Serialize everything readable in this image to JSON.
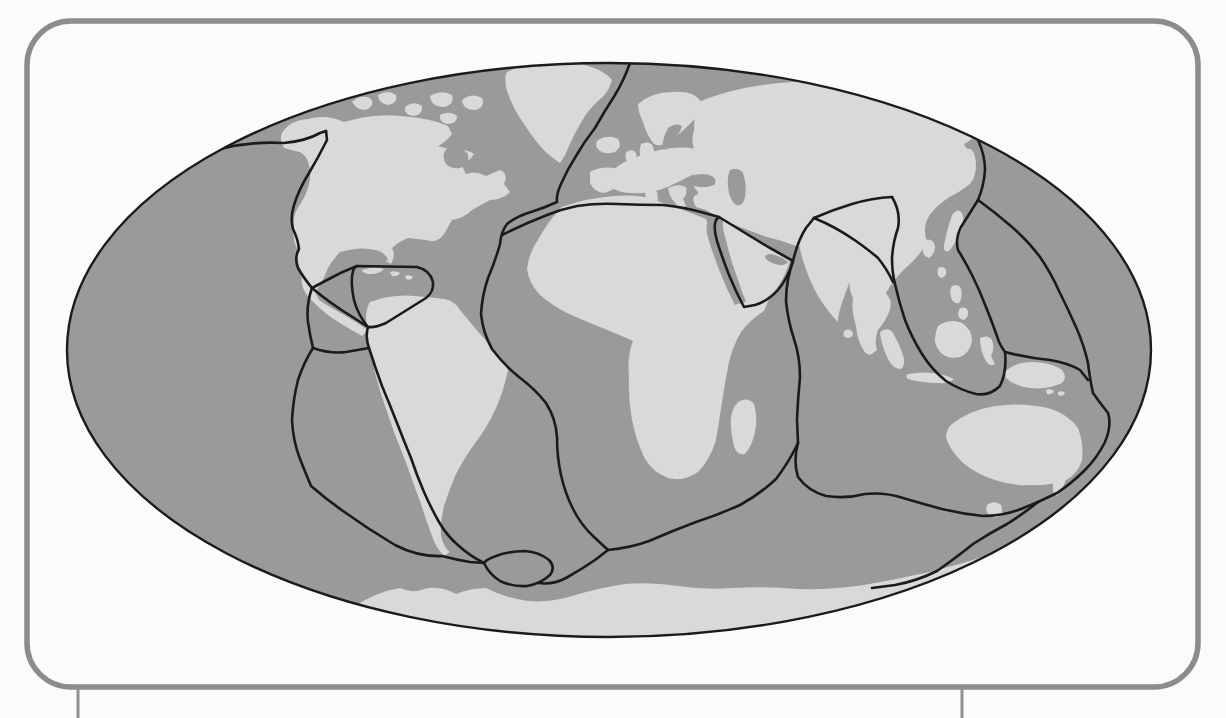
{
  "page": {
    "background": "#fbfbfa"
  },
  "frame": {
    "x": 27,
    "y": 21,
    "width": 1171,
    "height": 666,
    "radius": 44,
    "color": "#8a8c8e",
    "stroke_width": 5.5
  },
  "page_rule_lines": [
    {
      "name": "page-rule-left",
      "x": 78,
      "y1": 687,
      "y2": 718,
      "width": 3,
      "color": "#8f9193"
    },
    {
      "name": "page-rule-right",
      "x": 962,
      "y1": 687,
      "y2": 718,
      "width": 3,
      "color": "#8f9193"
    }
  ],
  "map": {
    "ellipse": {
      "cx": 609,
      "cy": 350,
      "rx": 542,
      "ry": 287
    },
    "colors": {
      "ocean": "#9a9a9b",
      "land": "#d9d9d8",
      "sea": "#9a9a9b",
      "boundary": "#1b1b1b",
      "outline": "#1b1b1b"
    },
    "boundary_stroke_width": 2.6,
    "outline_stroke_width": 2.4,
    "landmasses": [
      {
        "name": "north-america",
        "d": "M 282,133 Q 290,120 308,119 Q 326,114 344,122 L 360,118 Q 385,113 410,117 Q 432,119 448,126 L 452,134 Q 446,142 438,146 L 452,150 Q 466,148 474,154 Q 470,162 460,162 L 466,174 Q 476,170 486,176 L 500,170 Q 509,174 504,184 L 510,192 Q 502,200 490,200 L 472,210 Q 464,218 452,220 L 444,234 Q 437,244 426,240 L 408,238 Q 398,242 392,248 Q 396,256 391,264 Q 383,260 376,254 L 362,252 Q 350,250 340,252 Q 332,260 327,270 Q 323,282 315,292 L 319,300 Q 331,308 344,315 Q 356,322 368,330 L 362,336 Q 346,327 332,318 Q 318,308 306,294 Q 300,284 302,274 Q 296,262 298,250 Q 292,240 294,228 Q 292,216 299,206 Q 306,196 309,184 Q 312,172 308,162 Q 305,152 295,151 L 284,148 Q 279,140 282,133 Z"
      },
      {
        "name": "greenland",
        "d": "M 506,73 Q 522,63 545,62 Q 568,60 588,66 Q 605,71 612,80 Q 608,94 598,101 Q 588,110 582,121 Q 574,134 569,146 Q 566,155 560,163 Q 549,156 540,146 Q 530,134 522,121 Q 513,108 509,96 Q 504,86 506,73 Z"
      },
      {
        "name": "arctic-islands",
        "d": "M 352,102 q 8,-8 18,-4 q 6,6 -2,11 q -10,3 -16,-7 Z M 378,95 q 10,-6 18,0 q 2,8 -8,10 q -10,-2 -10,-10 Z M 405,107 q 9,-7 17,-1 q 1,9 -9,10 q -9,-1 -8,-9 Z M 430,96 q 12,-7 22,-1 q 3,9 -8,12 q -13,0 -14,-11 Z M 440,115 q 10,-5 17,1 q 0,8 -9,8 q -9,-1 -8,-9 Z M 462,100 q 10,-8 20,-2 q 4,9 -7,12 q -12,0 -13,-10 Z"
      },
      {
        "name": "iceland",
        "d": "M 598,140 q 10,-6 20,-1 q 5,7 -3,13 q -12,4 -18,-4 q -2,-5 1,-8 Z"
      },
      {
        "name": "british-isles",
        "d": "M 641,144 q 8,-4 12,2 q 3,10 -2,20 q -6,4 -9,-3 q -4,-10 -1,-19 Z M 626,152 q 7,-4 10,1 q 2,7 -4,10 q -8,0 -6,-11 Z"
      },
      {
        "name": "scandinavia",
        "d": "M 638,104 Q 652,92 672,92 Q 692,90 700,100 Q 703,112 694,120 Q 684,130 672,140 Q 662,148 654,144 Q 646,134 643,122 Q 638,112 638,104 Z"
      },
      {
        "name": "europe",
        "d": "M 606,178 Q 616,164 634,158 Q 652,150 672,148 Q 692,146 706,152 L 716,158 Q 706,168 694,174 Q 682,180 670,186 Q 656,192 642,193 Q 626,194 616,190 Q 606,186 606,178 Z"
      },
      {
        "name": "iberia",
        "d": "M 590,172 Q 600,166 614,168 Q 624,170 622,180 Q 616,190 604,193 Q 594,192 590,183 Z"
      },
      {
        "name": "italy",
        "d": "M 645,190 q 8,-4 12,2 q 2,8 -1,14 l 2,6 q -5,3 -8,-3 q -5,-9 -5,-19 Z"
      },
      {
        "name": "balkans-greece",
        "d": "M 668,188 q 10,-5 18,-1 q 2,7 -3,12 l 3,7 q -6,4 -10,-2 q -7,-7 -8,-16 Z"
      },
      {
        "name": "anatolia",
        "d": "M 694,196 q 14,-6 28,-3 l 14,6 q -4,9 -14,10 q -14,3 -26,-2 q -4,-6 -2,-11 Z"
      },
      {
        "name": "asia-mainland",
        "d": "M 698,102 Q 740,85 792,82 Q 845,78 893,88 Q 932,95 958,108 Q 974,118 980,128 Q 976,138 964,144 Q 970,154 974,166 Q 976,176 970,184 Q 960,192 948,198 Q 936,206 929,216 Q 922,228 927,242 Q 921,254 910,264 Q 898,274 889,288 Q 881,300 878,314 Q 872,326 866,334 Q 871,344 874,352 Q 870,358 864,351 Q 857,340 856,326 Q 851,312 853,298 Q 847,286 851,272 Q 843,262 828,256 Q 812,250 796,246 Q 780,240 764,236 Q 748,230 732,224 Q 718,218 706,210 Q 696,202 698,192 Q 690,184 694,174 Q 688,164 696,154 Q 690,142 694,130 Q 694,114 698,102 Z"
      },
      {
        "name": "kamchatka",
        "d": "M 962,150 q 8,-4 12,3 q 4,12 0,24 q -3,8 -9,4 q -6,-12 -6,-22 q 0,-6 3,-9 Z"
      },
      {
        "name": "japan-sakhalin",
        "d": "M 952,215 q 6,-8 10,-2 q 3,9 -1,18 q -5,12 -12,20 q -6,2 -5,-6 q 3,-16 8,-30 Z"
      },
      {
        "name": "korea",
        "d": "M 925,240 q 8,-2 10,6 q 0,8 -6,12 q -7,-2 -6,-9 q 0,-5 2,-9 Z"
      },
      {
        "name": "india",
        "d": "M 800,238 Q 822,228 846,238 Q 858,248 855,264 Q 850,282 843,300 Q 838,314 838,322 Q 828,312 818,296 Q 808,278 803,260 Q 798,246 800,238 Z"
      },
      {
        "name": "sri-lanka",
        "d": "M 845,330 q 6,-2 8,3 q 0,5 -6,5 q -6,-2 -2,-8 Z"
      },
      {
        "name": "indochina-malay",
        "d": "M 862,300 Q 872,290 884,292 Q 893,298 890,310 Q 885,322 878,330 Q 874,340 877,350 Q 871,356 866,348 Q 860,336 860,322 Q 858,310 862,300 Z"
      },
      {
        "name": "arabia",
        "d": "M 723,220 Q 748,234 772,248 L 790,260 Q 786,275 777,288 Q 768,299 756,304 L 747,304 Q 741,290 736,274 Q 730,258 726,240 Q 722,228 723,220 Z"
      },
      {
        "name": "africa",
        "d": "M 565,206 Q 588,198 614,196 Q 638,194 652,199 L 674,207 Q 692,213 706,219 Q 713,238 721,262 Q 728,284 736,300 L 739,304 Q 753,299 769,299 L 764,311 Q 750,320 741,332 Q 733,346 729,362 Q 725,382 722,402 Q 719,422 716,440 Q 710,460 698,472 Q 684,482 668,478 Q 652,472 644,457 Q 636,440 632,420 Q 628,398 629,377 Q 627,356 633,341 Q 620,335 605,329 Q 587,322 569,314 Q 551,305 539,294 Q 529,283 527,269 Q 529,252 539,238 Q 548,222 558,211 Q 561,206 565,206 Z"
      },
      {
        "name": "madagascar",
        "d": "M 738,402 q 10,-6 16,2 q 4,14 1,28 q -3,14 -10,22 q -8,2 -11,-8 q -4,-16 -3,-28 q 1,-10 7,-16 Z"
      },
      {
        "name": "south-america",
        "d": "M 370,302 Q 392,294 415,296 L 445,299 Q 456,302 460,310 Q 470,322 480,334 Q 492,346 502,360 L 508,370 Q 504,390 496,408 Q 488,426 476,442 Q 464,458 456,474 Q 449,490 444,506 Q 440,522 441,536 Q 444,548 450,552 L 444,556 Q 436,548 432,536 Q 426,520 421,504 Q 414,486 408,468 Q 401,450 394,432 Q 387,412 381,394 Q 375,374 371,356 Q 367,336 366,318 Q 366,308 370,302 Z"
      },
      {
        "name": "caribbean-islands",
        "d": "M 362,270 q 12,-4 22,-1 q -4,5 -14,5 q -7,0 -8,-4 Z M 390,272 q 6,-2 10,1 q -2,4 -8,3 Z M 405,276 q 5,-2 8,1 q -2,4 -7,2 Z"
      },
      {
        "name": "sumatra",
        "d": "M 880,332 q 8,-6 13,1 q 6,10 10,22 q 3,10 -2,14 q -8,0 -13,-10 q -7,-14 -8,-27 Z"
      },
      {
        "name": "java",
        "d": "M 908,374 q 16,-3 32,0 q 8,2 14,5 q -6,5 -16,4 q -16,0 -30,-4 q -3,-3 0,-5 Z"
      },
      {
        "name": "borneo",
        "d": "M 938,326 q 12,-8 24,-3 q 10,6 10,18 q -2,12 -12,16 q -12,3 -20,-5 q -6,-8 -5,-14 q 1,-8 3,-12 Z"
      },
      {
        "name": "sulawesi",
        "d": "M 980,338 q 8,-4 12,2 q 3,8 -1,16 l 4,8 q -6,3 -9,-3 q -6,-10 -6,-23 Z"
      },
      {
        "name": "philippines",
        "d": "M 952,286 q 7,-3 9,3 q 2,8 -2,14 q -6,1 -8,-6 q -2,-7 1,-11 Z M 960,308 q 6,-2 8,3 q 1,6 -4,9 q -6,-1 -6,-7 Z"
      },
      {
        "name": "taiwan",
        "d": "M 938,268 q 6,-3 8,2 q 1,6 -4,8 q -6,-1 -4,-10 Z"
      },
      {
        "name": "new-guinea",
        "d": "M 1005,372 Q 1015,362 1032,362 Q 1050,362 1062,370 Q 1068,377 1062,383 Q 1048,390 1030,388 Q 1014,386 1006,378 Z M 1046,390 q 5,-2 8,1 q -2,4 -7,3 Z M 1058,392 q 5,-2 7,1 q -2,4 -7,2 Z"
      },
      {
        "name": "australia",
        "d": "M 952,424 Q 970,410 995,406 Q 1022,402 1048,408 Q 1068,414 1078,428 Q 1084,444 1082,460 Q 1078,474 1066,480 Q 1050,486 1032,485 Q 1012,486 995,480 Q 976,474 962,462 Q 950,450 946,438 Q 946,429 952,424 Z"
      },
      {
        "name": "tasmania",
        "d": "M 988,504 q 8,-4 13,1 q 3,7 -3,12 q -8,2 -11,-5 q -2,-5 1,-8 Z"
      },
      {
        "name": "new-zealand",
        "d": "M 1055,474 q 7,-6 10,0 q 2,8 -3,14 l -5,8 q -5,-2 -4,-9 q 0,-8 2,-13 Z"
      },
      {
        "name": "antarctica",
        "d": "M 352,608 Q 375,592 400,588 Q 412,594 424,589 Q 440,585 456,594 Q 470,588 486,588 Q 505,598 528,601 Q 550,603 572,596 Q 598,588 625,584 Q 652,582 678,586 Q 705,590 732,588 Q 765,586 798,589 Q 832,590 864,585 Q 898,579 930,572 Q 962,564 995,553 Q 1020,546 1045,544 L 1058,645 L 345,645 Z"
      }
    ],
    "seas": [
      {
        "name": "hudson-bay",
        "d": "M 448,148 q 14,-2 20,6 q 2,10 -8,14 q -12,2 -16,-8 q -2,-8 4,-12 Z"
      },
      {
        "name": "gulf-of-mexico",
        "d": "M 342,252 q 16,-6 34,-2 q 10,3 12,10 q -14,6 -30,4 q -14,-2 -18,-7 q -2,-3 2,-5 Z"
      },
      {
        "name": "baltic-sea",
        "d": "M 668,128 q 8,-6 14,-2 q -2,8 -10,14 l -6,10 q -5,-2 -3,-9 q 2,-8 5,-13 Z"
      },
      {
        "name": "black-sea",
        "d": "M 692,176 q 10,-4 20,0 q 6,4 2,9 q -10,4 -20,1 q -6,-5 -2,-10 Z"
      },
      {
        "name": "caspian-sea",
        "d": "M 730,170 q 9,-3 13,3 q 4,12 2,24 q -2,10 -9,8 q -7,-6 -8,-18 q -1,-11 2,-17 Z"
      },
      {
        "name": "red-sea",
        "d": "M 710,219 Q 716,238 723,258 Q 729,276 736,292 L 741,302 L 735,305 Q 727,290 720,272 Q 712,252 707,234 Q 705,224 710,219 Z"
      },
      {
        "name": "persian-gulf",
        "d": "M 770,254 q 12,2 18,8 q -4,5 -13,2 q -9,-3 -10,-7 q 1,-3 5,-3 Z"
      }
    ],
    "plate_boundaries": [
      {
        "name": "aleutian-trench-west",
        "d": "M 220,149 Q 252,141 284,143 Q 306,141 320,133 L 326,131"
      },
      {
        "name": "pacific-north-america-boundary",
        "d": "M 326,131 L 327,140 Q 318,158 309,173 Q 299,189 294,205 Q 290,218 293,229 Q 298,239 299,249 Q 294,258 298,268 Q 303,277 312,288"
      },
      {
        "name": "middle-america-trench",
        "d": "M 312,288 Q 331,304 351,316 L 368,327"
      },
      {
        "name": "caribbean-plate-outline",
        "d": "M 357,266 L 417,267 Q 430,270 433,282 Q 434,292 426,298 L 386,323 Q 375,328 368,327 Q 358,315 354,300 Q 350,281 353,271 Q 354,267 357,266 Z"
      },
      {
        "name": "cocos-caribbean-link",
        "d": "M 357,266 Q 341,272 327,280 L 312,288"
      },
      {
        "name": "east-pacific-rise",
        "d": "M 312,288 Q 306,305 308,322 Q 310,336 313,348 Q 304,362 298,380 Q 293,400 292,420 Q 293,441 300,459 Q 306,474 311,486 Q 326,499 343,511 Q 368,529 395,545 Q 418,557 442,556 Q 457,560 470,562 L 484,563"
      },
      {
        "name": "galapagos-ridge",
        "d": "M 313,348 Q 330,354 346,352 L 369,348"
      },
      {
        "name": "peru-chile-trench",
        "d": "M 368,327 Q 365,337 369,348 Q 375,367 382,386 Q 390,405 397,423 Q 404,441 411,458 Q 417,476 424,492 Q 431,508 439,522 Q 447,536 459,546 Q 470,556 484,563"
      },
      {
        "name": "scotia-arc",
        "d": "M 484,563 Q 489,574 500,581 Q 513,587 527,586 Q 540,584 550,575 Q 556,567 549,560 Q 539,552 525,551 Q 509,551 496,556 Q 487,559 484,563 Z"
      },
      {
        "name": "scotia-atlantic-link",
        "d": "M 538,583 Q 553,585 566,578 Q 582,569 595,560 L 608,550"
      },
      {
        "name": "mid-atlantic-ridge",
        "d": "M 630,63 Q 624,80 615,95 Q 604,112 595,128 Q 584,142 576,156 Q 567,170 561,184 Q 556,195 557,202 Q 544,208 531,212 Q 517,216 507,224 Q 501,232 500,244 Q 495,262 488,278 Q 482,296 481,314 Q 483,333 492,349 Q 504,365 519,377 Q 535,389 546,403 Q 556,419 557,437 Q 557,457 561,475 Q 565,493 573,509 Q 581,525 594,537 L 608,550"
      },
      {
        "name": "eurasia-africa-boundary",
        "d": "M 502,235 Q 524,224 547,215 Q 562,209 577,206 Q 597,203 617,204 Q 641,205 663,205 Q 683,207 701,212 L 719,217"
      },
      {
        "name": "arabian-plate-outline",
        "d": "M 719,217 Q 745,233 770,248 L 793,261 Q 788,278 778,290 Q 768,301 755,305 L 744,307 Q 736,292 729,275 Q 722,257 717,241 Q 713,227 716,220 L 719,217 Z"
      },
      {
        "name": "zagros-link",
        "d": "M 793,261 Q 798,240 806,228 L 814,218"
      },
      {
        "name": "himalayan-front",
        "d": "M 814,218 Q 832,210 852,204 Q 872,198 892,197"
      },
      {
        "name": "iran-makran-boundary",
        "d": "M 814,218 Q 836,227 856,241 Q 870,251 878,258 Q 887,269 893,282"
      },
      {
        "name": "burma-sunda-trench",
        "d": "M 892,197 Q 901,212 898,228 Q 893,242 892,258 Q 892,272 895,284 Q 899,302 905,320 Q 912,338 922,354 Q 932,370 946,381 Q 960,390 976,394 Q 990,396 1000,386 Q 1007,372 1005,352"
      },
      {
        "name": "owen-central-indian-ridge",
        "d": "M 793,261 Q 786,281 786,301 Q 788,321 794,339 Q 800,357 800,377 Q 798,397 797,419 L 798,443"
      },
      {
        "name": "southwest-indian-ridge",
        "d": "M 798,443 Q 789,462 776,479 Q 760,494 740,505 Q 718,515 696,522 Q 672,531 649,541 Q 630,548 608,550"
      },
      {
        "name": "southeast-indian-ridge",
        "d": "M 798,443 Q 793,461 798,477 Q 808,491 826,496 Q 846,499 865,494 Q 885,492 903,498 Q 923,504 942,509 Q 963,514 983,516 Q 1003,516 1021,509 L 1038,502"
      },
      {
        "name": "pacific-antarctic-boundary",
        "d": "M 1038,502 Q 1023,514 1007,524 Q 990,533 973,544 Q 957,557 937,571 Q 917,581 895,585 L 872,588"
      },
      {
        "name": "japan-marianas-trench",
        "d": "M 978,140 Q 985,155 985,170 Q 984,186 978,200 Q 970,213 961,227 Q 955,239 958,250 Q 966,263 972,275 Q 980,291 986,307 Q 992,322 997,336 Q 999,344 1005,352"
      },
      {
        "name": "philippine-tonga-boundary",
        "d": "M 978,200 Q 996,213 1012,227 Q 1028,241 1040,257 Q 1051,273 1059,291 Q 1068,309 1076,327 Q 1084,345 1088,363 Q 1090,380 1093,393 Q 1100,403 1108,413 Q 1112,425 1105,442 Q 1097,458 1085,470 Q 1072,483 1057,493 L 1038,502"
      },
      {
        "name": "new-guinea-boundary",
        "d": "M 1005,352 Q 1028,358 1050,360 Q 1068,363 1080,370 L 1088,380"
      }
    ]
  }
}
